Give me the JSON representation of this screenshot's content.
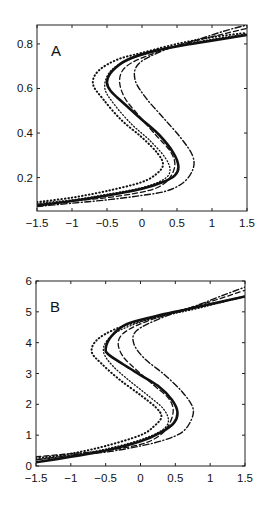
{
  "chart_data": [
    {
      "type": "line",
      "panel_label": "A",
      "title": "",
      "xlabel": "",
      "ylabel": "",
      "xlim": [
        -1.5,
        1.5
      ],
      "ylim": [
        0.05,
        0.885
      ],
      "grid": false,
      "legend": "none",
      "xticks": [
        -1.5,
        -1,
        -0.5,
        0,
        0.5,
        1,
        1.5
      ],
      "xtick_labels": [
        "−1.5",
        "−1",
        "−0.5",
        "0",
        "0.5",
        "1",
        "1.5"
      ],
      "yticks": [
        0.2,
        0.4,
        0.6,
        0.8
      ],
      "ytick_labels": [
        "0.2",
        "0.4",
        "0.6",
        "0.8"
      ],
      "series": [
        {
          "name": "solid-thick",
          "style": "solid-thick",
          "points": [
            [
              -1.5,
              0.075
            ],
            [
              -1.0,
              0.095
            ],
            [
              -0.5,
              0.12
            ],
            [
              0.0,
              0.15
            ],
            [
              0.3,
              0.18
            ],
            [
              0.47,
              0.21
            ],
            [
              0.52,
              0.25
            ],
            [
              0.45,
              0.31
            ],
            [
              0.25,
              0.39
            ],
            [
              0.0,
              0.46
            ],
            [
              -0.25,
              0.53
            ],
            [
              -0.45,
              0.59
            ],
            [
              -0.5,
              0.63
            ],
            [
              -0.42,
              0.68
            ],
            [
              -0.2,
              0.73
            ],
            [
              0.2,
              0.77
            ],
            [
              0.7,
              0.8
            ],
            [
              1.5,
              0.84
            ]
          ]
        },
        {
          "name": "dotted-left",
          "style": "dotted",
          "points": [
            [
              -1.5,
              0.09
            ],
            [
              -1.0,
              0.11
            ],
            [
              -0.5,
              0.14
            ],
            [
              0.0,
              0.18
            ],
            [
              0.22,
              0.22
            ],
            [
              0.3,
              0.26
            ],
            [
              0.22,
              0.31
            ],
            [
              0.0,
              0.38
            ],
            [
              -0.3,
              0.46
            ],
            [
              -0.55,
              0.55
            ],
            [
              -0.7,
              0.62
            ],
            [
              -0.62,
              0.68
            ],
            [
              -0.35,
              0.73
            ],
            [
              0.0,
              0.76
            ],
            [
              0.5,
              0.8
            ],
            [
              1.0,
              0.83
            ],
            [
              1.5,
              0.85
            ]
          ]
        },
        {
          "name": "dotted-inner",
          "style": "dotted-fine",
          "points": [
            [
              -1.5,
              0.085
            ],
            [
              -1.0,
              0.1
            ],
            [
              -0.5,
              0.125
            ],
            [
              0.0,
              0.155
            ],
            [
              0.3,
              0.19
            ],
            [
              0.4,
              0.23
            ],
            [
              0.33,
              0.29
            ],
            [
              0.1,
              0.37
            ],
            [
              -0.15,
              0.44
            ],
            [
              -0.4,
              0.53
            ],
            [
              -0.53,
              0.6
            ],
            [
              -0.47,
              0.67
            ],
            [
              -0.25,
              0.72
            ],
            [
              0.2,
              0.77
            ],
            [
              0.8,
              0.81
            ],
            [
              1.5,
              0.845
            ]
          ]
        },
        {
          "name": "dashed",
          "style": "dashed",
          "points": [
            [
              -1.5,
              0.08
            ],
            [
              -1.0,
              0.095
            ],
            [
              -0.5,
              0.11
            ],
            [
              0.0,
              0.135
            ],
            [
              0.25,
              0.16
            ],
            [
              0.4,
              0.2
            ],
            [
              0.47,
              0.26
            ],
            [
              0.4,
              0.32
            ],
            [
              0.2,
              0.39
            ],
            [
              -0.05,
              0.48
            ],
            [
              -0.25,
              0.56
            ],
            [
              -0.32,
              0.64
            ],
            [
              -0.22,
              0.7
            ],
            [
              0.1,
              0.75
            ],
            [
              0.6,
              0.8
            ],
            [
              1.1,
              0.84
            ],
            [
              1.5,
              0.87
            ]
          ]
        },
        {
          "name": "dash-dot-right",
          "style": "dashdot",
          "points": [
            [
              -1.5,
              0.07
            ],
            [
              -1.0,
              0.085
            ],
            [
              -0.5,
              0.1
            ],
            [
              0.0,
              0.12
            ],
            [
              0.35,
              0.14
            ],
            [
              0.6,
              0.18
            ],
            [
              0.73,
              0.24
            ],
            [
              0.72,
              0.3
            ],
            [
              0.55,
              0.38
            ],
            [
              0.3,
              0.47
            ],
            [
              0.05,
              0.56
            ],
            [
              -0.1,
              0.64
            ],
            [
              -0.05,
              0.71
            ],
            [
              0.3,
              0.77
            ],
            [
              0.8,
              0.82
            ],
            [
              1.2,
              0.86
            ],
            [
              1.5,
              0.885
            ]
          ]
        }
      ]
    },
    {
      "type": "line",
      "panel_label": "B",
      "title": "",
      "xlabel": "",
      "ylabel": "",
      "xlim": [
        -1.5,
        1.5
      ],
      "ylim": [
        0,
        6
      ],
      "grid": false,
      "legend": "none",
      "xticks": [
        -1.5,
        -1,
        -0.5,
        0,
        0.5,
        1,
        1.5
      ],
      "xtick_labels": [
        "−1.5",
        "−1",
        "−0.5",
        "0",
        "0.5",
        "1",
        "1.5"
      ],
      "yticks": [
        0,
        1,
        2,
        3,
        4,
        5,
        6
      ],
      "ytick_labels": [
        "0",
        "1",
        "2",
        "3",
        "4",
        "5",
        "6"
      ],
      "series": [
        {
          "name": "solid-thick",
          "style": "solid-thick",
          "points": [
            [
              -1.5,
              0.12
            ],
            [
              -1.0,
              0.3
            ],
            [
              -0.5,
              0.5
            ],
            [
              0.0,
              0.8
            ],
            [
              0.3,
              1.1
            ],
            [
              0.48,
              1.4
            ],
            [
              0.53,
              1.75
            ],
            [
              0.45,
              2.15
            ],
            [
              0.25,
              2.6
            ],
            [
              0.0,
              2.95
            ],
            [
              -0.25,
              3.3
            ],
            [
              -0.45,
              3.6
            ],
            [
              -0.5,
              3.8
            ],
            [
              -0.42,
              4.2
            ],
            [
              -0.2,
              4.6
            ],
            [
              0.2,
              4.85
            ],
            [
              0.7,
              5.1
            ],
            [
              1.5,
              5.5
            ]
          ]
        },
        {
          "name": "dotted-left",
          "style": "dotted",
          "points": [
            [
              -1.5,
              0.25
            ],
            [
              -1.0,
              0.4
            ],
            [
              -0.5,
              0.65
            ],
            [
              0.0,
              1.0
            ],
            [
              0.2,
              1.3
            ],
            [
              0.3,
              1.6
            ],
            [
              0.22,
              1.9
            ],
            [
              0.0,
              2.3
            ],
            [
              -0.3,
              2.8
            ],
            [
              -0.55,
              3.3
            ],
            [
              -0.7,
              3.7
            ],
            [
              -0.62,
              4.1
            ],
            [
              -0.35,
              4.45
            ],
            [
              0.0,
              4.7
            ],
            [
              0.5,
              5.0
            ],
            [
              1.0,
              5.25
            ],
            [
              1.5,
              5.5
            ]
          ]
        },
        {
          "name": "dotted-inner",
          "style": "dotted-fine",
          "points": [
            [
              -1.5,
              0.2
            ],
            [
              -1.0,
              0.35
            ],
            [
              -0.5,
              0.55
            ],
            [
              0.0,
              0.85
            ],
            [
              0.3,
              1.15
            ],
            [
              0.4,
              1.45
            ],
            [
              0.33,
              1.85
            ],
            [
              0.1,
              2.3
            ],
            [
              -0.15,
              2.75
            ],
            [
              -0.4,
              3.25
            ],
            [
              -0.53,
              3.7
            ],
            [
              -0.47,
              4.1
            ],
            [
              -0.25,
              4.45
            ],
            [
              0.2,
              4.8
            ],
            [
              0.8,
              5.1
            ],
            [
              1.5,
              5.5
            ]
          ]
        },
        {
          "name": "dashed",
          "style": "dashed",
          "points": [
            [
              -1.5,
              0.3
            ],
            [
              -1.0,
              0.4
            ],
            [
              -0.5,
              0.5
            ],
            [
              0.0,
              0.7
            ],
            [
              0.25,
              0.95
            ],
            [
              0.4,
              1.3
            ],
            [
              0.47,
              1.8
            ],
            [
              0.4,
              2.2
            ],
            [
              0.2,
              2.6
            ],
            [
              -0.05,
              3.1
            ],
            [
              -0.25,
              3.55
            ],
            [
              -0.32,
              4.0
            ],
            [
              -0.22,
              4.35
            ],
            [
              0.1,
              4.7
            ],
            [
              0.6,
              5.05
            ],
            [
              1.1,
              5.4
            ],
            [
              1.5,
              5.7
            ]
          ]
        },
        {
          "name": "dash-dot-right",
          "style": "dashdot",
          "points": [
            [
              -1.5,
              0.2
            ],
            [
              -1.0,
              0.35
            ],
            [
              -0.5,
              0.45
            ],
            [
              0.0,
              0.65
            ],
            [
              0.35,
              0.85
            ],
            [
              0.6,
              1.1
            ],
            [
              0.73,
              1.5
            ],
            [
              0.75,
              1.9
            ],
            [
              0.6,
              2.4
            ],
            [
              0.35,
              2.95
            ],
            [
              0.05,
              3.5
            ],
            [
              -0.1,
              4.0
            ],
            [
              -0.05,
              4.4
            ],
            [
              0.3,
              4.8
            ],
            [
              0.8,
              5.2
            ],
            [
              1.2,
              5.55
            ],
            [
              1.5,
              5.8
            ]
          ]
        }
      ]
    }
  ]
}
